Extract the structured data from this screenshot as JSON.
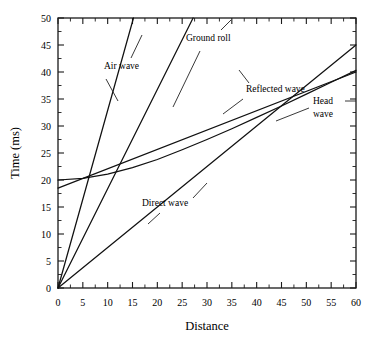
{
  "chart_data": {
    "type": "line",
    "title": "",
    "xlabel": "Distance",
    "ylabel": "Time (ms)",
    "xlim": [
      0,
      60
    ],
    "ylim": [
      0,
      50
    ],
    "grid": false,
    "legend_position": "inline-annotations",
    "xticks": [
      0,
      5,
      10,
      15,
      20,
      25,
      30,
      35,
      40,
      45,
      50,
      55,
      60
    ],
    "xticklabels": [
      "0",
      "5",
      "10",
      "15",
      "20",
      "25",
      "30",
      "35",
      "40",
      "45",
      "50",
      "55",
      "60"
    ],
    "yticks": [
      0,
      5,
      10,
      15,
      20,
      25,
      30,
      35,
      40,
      45,
      50
    ],
    "yticklabels": [
      "0",
      "5",
      "10",
      "15",
      "20",
      "25",
      "30",
      "35",
      "40",
      "45",
      "50"
    ],
    "series": [
      {
        "name": "Air wave",
        "label": "Air wave",
        "kind": "straight",
        "points": [
          [
            0,
            0
          ],
          [
            15.2,
            50
          ]
        ],
        "slope_ms_per_unit": 3.29,
        "intercept_ms": 0
      },
      {
        "name": "Ground roll",
        "label": "Ground roll",
        "kind": "straight",
        "points": [
          [
            0,
            0
          ],
          [
            27.2,
            50
          ]
        ],
        "slope_ms_per_unit": 1.84,
        "intercept_ms": 0
      },
      {
        "name": "Direct wave",
        "label": "Direct wave",
        "kind": "straight",
        "points": [
          [
            0,
            0
          ],
          [
            60,
            45
          ]
        ],
        "slope_ms_per_unit": 0.75,
        "intercept_ms": 0
      },
      {
        "name": "Reflected wave",
        "label": "Reflected wave",
        "kind": "hyperbola",
        "points": [
          [
            0,
            20.0
          ],
          [
            5,
            20.3
          ],
          [
            10,
            21.1
          ],
          [
            15,
            22.3
          ],
          [
            20,
            23.8
          ],
          [
            25,
            25.6
          ],
          [
            30,
            27.5
          ],
          [
            35,
            29.5
          ],
          [
            40,
            31.6
          ],
          [
            45,
            33.7
          ],
          [
            50,
            35.9
          ],
          [
            55,
            38.1
          ],
          [
            60,
            40.3
          ]
        ],
        "intercept_ms": 20.0
      },
      {
        "name": "Head wave",
        "label": "Head wave",
        "kind": "straight",
        "points": [
          [
            0,
            18.5
          ],
          [
            60,
            40.0
          ]
        ],
        "slope_ms_per_unit": 0.358,
        "intercept_ms": 18.5
      }
    ],
    "annotations": [
      {
        "text": "Air wave",
        "target_series": "Air wave",
        "x_px": 104,
        "y_px": 69
      },
      {
        "text": "Ground roll",
        "target_series": "Ground roll",
        "x_px": 186,
        "y_px": 41
      },
      {
        "text": "Reflected wave",
        "target_series": "Reflected wave",
        "x_px": 246,
        "y_px": 92
      },
      {
        "text": "Head wave",
        "target_series": "Head wave",
        "x_px": 313,
        "y_px": 104
      },
      {
        "text": "Direct wave",
        "target_series": "Direct wave",
        "x_px": 142,
        "y_px": 206
      }
    ]
  },
  "labels": {
    "x_axis": "Distance",
    "y_axis": "Time (ms)",
    "air_wave": "Air wave",
    "ground_roll": "Ground roll",
    "reflected_wave": "Reflected wave",
    "head_wave_line1": "Head",
    "head_wave_line2": "wave",
    "direct_wave": "Direct wave"
  },
  "ticks": {
    "x": [
      "0",
      "5",
      "10",
      "15",
      "20",
      "25",
      "30",
      "35",
      "40",
      "45",
      "50",
      "55",
      "60"
    ],
    "y": [
      "0",
      "5",
      "10",
      "15",
      "20",
      "25",
      "30",
      "35",
      "40",
      "45",
      "50"
    ]
  },
  "colors": {
    "curve": "#111111",
    "frame": "#1a1a1a",
    "background": "#ffffff",
    "text": "#000000"
  }
}
